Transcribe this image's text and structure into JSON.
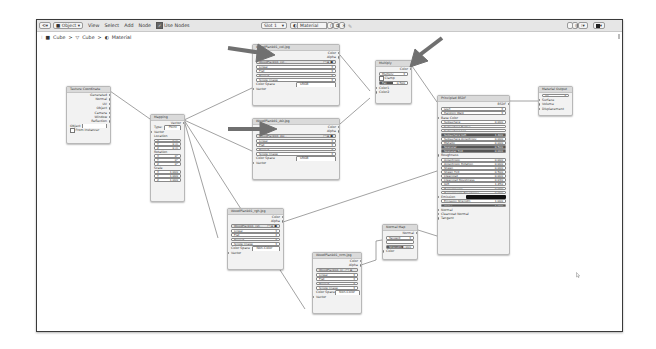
{
  "header": {
    "editor_type_icon": "node-editor-icon",
    "object_mode": "Object",
    "menus": [
      "View",
      "Select",
      "Add",
      "Node"
    ],
    "use_nodes_label": "Use Nodes",
    "use_nodes_checked": true,
    "slot": "Slot 1",
    "material": "Material",
    "right_icons": [
      "pin-icon",
      "overlay-icon",
      "snap-icon",
      "view-icon"
    ]
  },
  "breadcrumb": {
    "items": [
      "Cube",
      "Cube",
      "Material"
    ],
    "separator": ">"
  },
  "nodes": {
    "texcoord": {
      "title": "Texture Coordinate",
      "outputs": [
        "Generated",
        "Normal",
        "UV",
        "Object",
        "Camera",
        "Window",
        "Reflection"
      ],
      "object_label": "Object",
      "from_instancer": "From Instancer"
    },
    "mapping": {
      "title": "Mapping",
      "output": "Vector",
      "type_label": "Type:",
      "type_value": "Point",
      "vector_label": "Vector",
      "location_label": "Location",
      "location": [
        [
          "X",
          "0 m"
        ],
        [
          "Y",
          "0 m"
        ],
        [
          "Z",
          "0 m"
        ]
      ],
      "rotation_label": "Rotation",
      "rotation": [
        [
          "X",
          "0°"
        ],
        [
          "Y",
          "0°"
        ],
        [
          "Z",
          "0°"
        ]
      ],
      "scale_label": "Scale",
      "scale": [
        [
          "X",
          "1.000"
        ],
        [
          "Y",
          "1.000"
        ],
        [
          "Z",
          "1.000"
        ]
      ]
    },
    "img1": {
      "title": "WoodPlank01_col.jpg",
      "outputs": [
        "Color",
        "Alpha"
      ],
      "image_name": "WoodPlank01_col...",
      "interpolation": "Linear",
      "projection": "Flat",
      "extension": "Repeat",
      "source": "Single Image",
      "color_space_label": "Color Space",
      "color_space": "sRGB",
      "input": "Vector"
    },
    "img2": {
      "title": "WoodPlank01_AO.jpg",
      "outputs": [
        "Color",
        "Alpha"
      ],
      "image_name": "WoodPlank01_AO...",
      "interpolation": "Linear",
      "projection": "Flat",
      "extension": "Repeat",
      "source": "Single Image",
      "color_space_label": "Color Space",
      "color_space": "sRGB",
      "input": "Vector"
    },
    "img3": {
      "title": "WoodPlank01_rgh.jpg",
      "outputs": [
        "Color",
        "Alpha"
      ],
      "image_name": "WoodPlank01_rgh...",
      "interpolation": "Linear",
      "projection": "Flat",
      "extension": "Repeat",
      "source": "Single Image",
      "color_space_label": "Color Space",
      "color_space": "Non-Color",
      "input": "Vector"
    },
    "img4": {
      "title": "WoodPlank01_nrm.jpg",
      "outputs": [
        "Color",
        "Alpha"
      ],
      "image_name": "WoodPlank01_nr...",
      "interpolation": "Linear",
      "projection": "Flat",
      "extension": "Repeat",
      "source": "Single Image",
      "color_space_label": "Color Space",
      "color_space": "Non-Color",
      "input": "Vector"
    },
    "multiply": {
      "title": "Multiply",
      "output": "Color",
      "blend": "Multiply",
      "clamp": "Clamp",
      "fac_label": "Fac",
      "fac_value": "0.500",
      "inputs": [
        "Color1",
        "Color2"
      ]
    },
    "bsdf": {
      "title": "Principled BSDF",
      "output": "BSDF",
      "distribution": "GGX",
      "subsurface_method": "Random Walk",
      "base_color": "Base Color",
      "params": [
        [
          "Subsurface",
          "0.000"
        ],
        [
          "Subsurface Radius",
          ""
        ],
        [
          "Subsurface Col...",
          ""
        ],
        [
          "Subsurface IOR",
          "1.400"
        ],
        [
          "Subsurface Anisotropy",
          "0.000"
        ],
        [
          "Metallic",
          "0.000"
        ],
        [
          "Specular",
          "0.500"
        ],
        [
          "Specular Tint",
          "0.000"
        ],
        [
          "Roughness",
          ""
        ],
        [
          "Anisotropic",
          "0.000"
        ],
        [
          "Anisotropic Rotation",
          "0.000"
        ],
        [
          "Sheen",
          "0.000"
        ],
        [
          "Sheen Tint",
          "0.500"
        ],
        [
          "Clearcoat",
          "0.000"
        ],
        [
          "Clearcoat Roughness",
          "0.030"
        ],
        [
          "IOR",
          "1.450"
        ],
        [
          "Transmission",
          "0.000"
        ],
        [
          "Transmission Roughness",
          "0.000"
        ],
        [
          "Emission",
          ""
        ],
        [
          "Emission Strength",
          "1.000"
        ],
        [
          "Alpha",
          "1.000"
        ]
      ],
      "inputs_bottom": [
        "Normal",
        "Clearcoat Normal",
        "Tangent"
      ]
    },
    "output": {
      "title": "Material Output",
      "target": "All",
      "inputs": [
        "Surface",
        "Volume",
        "Displacement"
      ]
    },
    "normalmap": {
      "title": "Normal Map",
      "output": "Normal",
      "space": "Tangent Space",
      "uv": "",
      "strength_label": "Strength",
      "strength_value": "1.000",
      "input": "Color"
    }
  },
  "annotations": {
    "arrow_color": "#6e6e6e",
    "arrows": [
      "arrow-to-color-texture",
      "arrow-to-ao-texture",
      "arrow-to-multiply"
    ]
  }
}
